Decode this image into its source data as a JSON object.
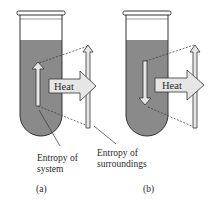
{
  "figure": {
    "panels": [
      {
        "id": "a",
        "caption": "(a)",
        "system_arrow_direction": "up",
        "heat_label": "Heat",
        "system_label_line1": "Entropy of",
        "system_label_line2": "system"
      },
      {
        "id": "b",
        "caption": "(b)",
        "system_arrow_direction": "down",
        "heat_label": "Heat",
        "surroundings_label_line1": "Entropy of",
        "surroundings_label_line2": "surroundings"
      }
    ],
    "colors": {
      "liquid": "#8a8a8a",
      "arrow_fill": "#e6e6e6",
      "outline": "#333333"
    }
  }
}
